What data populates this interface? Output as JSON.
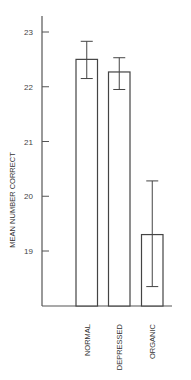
{
  "chart_data": {
    "type": "bar",
    "title": "",
    "xlabel": "",
    "ylabel": "MEAN NUMBER CORRECT",
    "categories": [
      "NORMAL",
      "DEPRESSED",
      "ORGANIC"
    ],
    "values": [
      22.5,
      22.27,
      19.3
    ],
    "error_bars": [
      {
        "low": 22.15,
        "high": 22.83
      },
      {
        "low": 21.95,
        "high": 22.53
      },
      {
        "low": 18.35,
        "high": 20.28
      }
    ],
    "yticks": [
      19,
      20,
      21,
      22,
      23
    ],
    "ylim": [
      18.0,
      23.3
    ],
    "grid": false,
    "legend": null,
    "colors": {
      "bar_fill": "#ffffff",
      "bar_stroke": "#444444",
      "axis": "#555555"
    }
  }
}
